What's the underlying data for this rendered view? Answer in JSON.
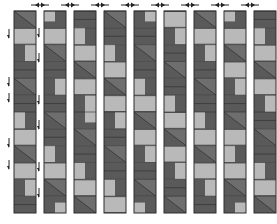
{
  "diagram": {
    "title": "",
    "colors": {
      "dark": "#5a5a5a",
      "mid": "#6e6e6e",
      "light": "#b9b9b9",
      "line": "#2e2e2e",
      "arrow": "#222222"
    },
    "strips": [
      {
        "name": "strip-1",
        "blocks": [
          "diag",
          "light-bar",
          "light-right",
          "dark",
          "diag",
          "dark",
          "light-left",
          "light-bar",
          "diag",
          "light-bar",
          "light-right",
          "dark"
        ]
      },
      {
        "name": "strip-2",
        "blocks": [
          "corner-tl",
          "light-bar",
          "diag",
          "dark",
          "light-right",
          "dark",
          "diag",
          "dark",
          "light-left",
          "light-bar",
          "diag",
          "corner-br"
        ]
      },
      {
        "name": "strip-3",
        "blocks": [
          "dark",
          "light-left",
          "light-bar",
          "diag",
          "light-bar",
          "light-right",
          "corner-tr",
          "diag",
          "dark",
          "light-left",
          "light-bar",
          "diag"
        ]
      },
      {
        "name": "strip-4",
        "blocks": [
          "diag",
          "dark",
          "light-left",
          "light-bar",
          "diag",
          "light-bar",
          "light-right",
          "dark",
          "diag",
          "dark",
          "light-left",
          "light-bar"
        ]
      },
      {
        "name": "strip-5",
        "blocks": [
          "corner-tr",
          "dark",
          "diag",
          "dark",
          "light-left",
          "light-bar",
          "diag",
          "light-bar",
          "light-right",
          "dark",
          "diag",
          "corner-bl"
        ]
      },
      {
        "name": "strip-6",
        "blocks": [
          "light-bar",
          "light-right",
          "dark",
          "diag",
          "dark",
          "light-left",
          "light-bar",
          "diag",
          "light-bar",
          "light-right",
          "dark",
          "diag"
        ]
      },
      {
        "name": "strip-7",
        "blocks": [
          "diag",
          "light-bar",
          "light-right",
          "dark",
          "diag",
          "dark",
          "light-left",
          "light-bar",
          "diag",
          "light-bar",
          "light-right",
          "dark"
        ]
      },
      {
        "name": "strip-8",
        "blocks": [
          "corner-tl",
          "light-bar",
          "diag",
          "light-bar",
          "light-right",
          "dark",
          "diag",
          "light-bar",
          "light-left",
          "light-bar",
          "diag",
          "corner-br"
        ]
      },
      {
        "name": "strip-9",
        "blocks": [
          "dark",
          "light-left",
          "light-bar",
          "diag",
          "light-bar",
          "light-right",
          "dark",
          "diag",
          "dark",
          "light-left",
          "light-bar",
          "diag"
        ]
      }
    ],
    "top_arrows": {
      "count": 8,
      "direction": "left-right",
      "between": [
        "strip-1/strip-2",
        "strip-2/strip-3",
        "strip-3/strip-4",
        "strip-4/strip-5",
        "strip-5/strip-6",
        "strip-6/strip-7",
        "strip-7/strip-8",
        "strip-8/strip-9"
      ]
    },
    "side_arrows": [
      {
        "side": "left-of-strip-1",
        "direction": "down",
        "count": 5
      },
      {
        "side": "left-of-strip-2",
        "direction": "down",
        "count": 6
      }
    ]
  }
}
